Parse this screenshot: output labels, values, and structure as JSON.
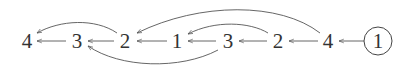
{
  "diagram": {
    "type": "tree-parent-pointer-chain",
    "nodes": [
      {
        "id": "n0",
        "label": "4",
        "x": 27,
        "y": 41,
        "circled": false
      },
      {
        "id": "n1",
        "label": "3",
        "x": 77,
        "y": 41,
        "circled": false
      },
      {
        "id": "n2",
        "label": "2",
        "x": 125,
        "y": 41,
        "circled": false
      },
      {
        "id": "n3",
        "label": "1",
        "x": 177,
        "y": 41,
        "circled": false
      },
      {
        "id": "n4",
        "label": "3",
        "x": 228,
        "y": 41,
        "circled": false
      },
      {
        "id": "n5",
        "label": "2",
        "x": 278,
        "y": 41,
        "circled": false
      },
      {
        "id": "n6",
        "label": "4",
        "x": 328,
        "y": 41,
        "circled": false
      },
      {
        "id": "n7",
        "label": "1",
        "x": 378,
        "y": 41,
        "circled": true
      }
    ],
    "edges": [
      {
        "from": "n1",
        "to": "n0",
        "style": "straight"
      },
      {
        "from": "n2",
        "to": "n1",
        "style": "straight"
      },
      {
        "from": "n3",
        "to": "n2",
        "style": "straight"
      },
      {
        "from": "n4",
        "to": "n3",
        "style": "straight"
      },
      {
        "from": "n5",
        "to": "n4",
        "style": "straight"
      },
      {
        "from": "n6",
        "to": "n5",
        "style": "straight"
      },
      {
        "from": "n7",
        "to": "n6",
        "style": "straight"
      },
      {
        "from": "n2",
        "to": "n0",
        "style": "curve-above"
      },
      {
        "from": "n4",
        "to": "n1",
        "style": "curve-below"
      },
      {
        "from": "n5",
        "to": "n3",
        "style": "curve-above"
      },
      {
        "from": "n6",
        "to": "n2",
        "style": "curve-above"
      }
    ]
  }
}
